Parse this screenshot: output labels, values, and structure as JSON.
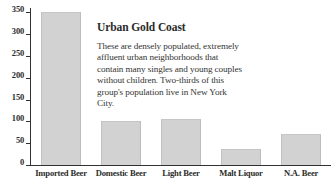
{
  "chart_data": {
    "type": "bar",
    "title": "",
    "xlabel": "",
    "ylabel": "",
    "categories": [
      "Imported Beer",
      "Domestic Beer",
      "Light Beer",
      "Malt Liquor",
      "N.A. Beer"
    ],
    "values": [
      350,
      100,
      105,
      37,
      70
    ],
    "ylim": [
      0,
      360
    ],
    "yticks": [
      0,
      50,
      100,
      150,
      200,
      250,
      300,
      350
    ],
    "ytick_labels": [
      "0",
      "50",
      "100",
      "150",
      "200",
      "250",
      "300",
      "350"
    ],
    "grid": false,
    "legend": false,
    "bar_color": "#d2d2d2",
    "axis_color": "#31322f",
    "text_color": "#2c2d2b",
    "annotation": {
      "title": "Urban Gold Coast",
      "body": "These are densely populated, extremely affluent urban neighborhoods that contain many singles and young couples without children.  Two-thirds of this group's population live in New York City."
    }
  }
}
